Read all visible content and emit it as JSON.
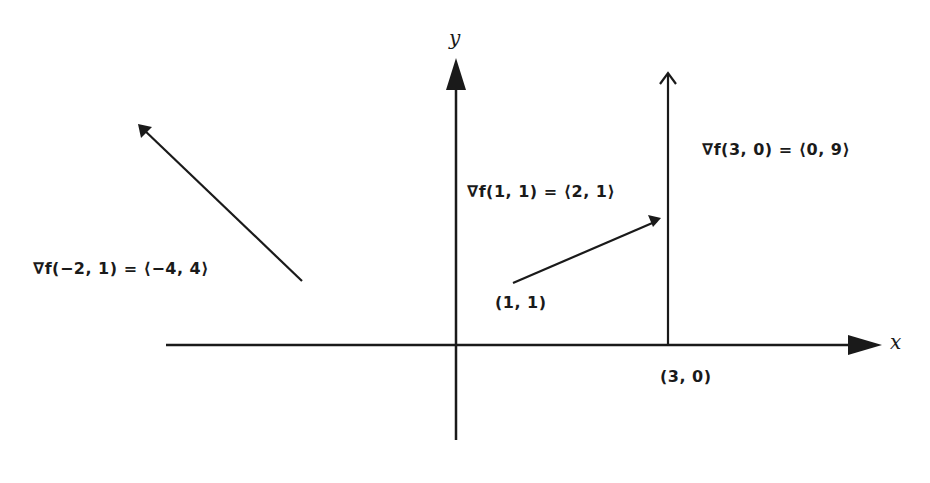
{
  "diagram": {
    "type": "gradient-vectors",
    "axes": {
      "x_label": "x",
      "y_label": "y"
    },
    "vectors": [
      {
        "point_label": "",
        "gradient_label": "∇f(−2, 1) = ⟨−4, 4⟩",
        "base": [
          -2,
          1
        ],
        "gradient": [
          -4,
          4
        ]
      },
      {
        "point_label": "(1, 1)",
        "gradient_label": "∇f(1, 1) = ⟨2, 1⟩",
        "base": [
          1,
          1
        ],
        "gradient": [
          2,
          1
        ]
      },
      {
        "point_label": "(3, 0)",
        "gradient_label": "∇f(3, 0) = ⟨0, 9⟩",
        "base": [
          3,
          0
        ],
        "gradient": [
          0,
          9
        ]
      }
    ],
    "colors": {
      "ink": "#1a1a1a",
      "background": "#ffffff"
    }
  }
}
